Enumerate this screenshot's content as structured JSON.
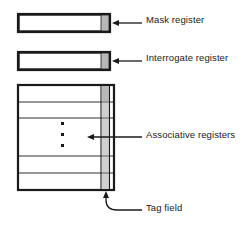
{
  "figure": {
    "background_color": "#ffffff",
    "line_color": "#1a1a1a",
    "tag_fill_color": "#b8b8b8",
    "cell_fill_color": "#ffffff"
  },
  "labels": {
    "mask": "Mask register",
    "interrogate": "Interrogate register",
    "associative": "Associative registers",
    "tag_field": "Tag field"
  },
  "registers": {
    "mask": {
      "name": "Mask register",
      "rows": 1,
      "has_tag_cell": true
    },
    "interrogate": {
      "name": "Interrogate register",
      "rows": 1,
      "has_tag_cell": true
    },
    "associative": {
      "name": "Associative registers",
      "rows": 6,
      "has_tag_column": true,
      "ellipsis": "vertical-ellipsis",
      "ellipsis_dots": 3
    }
  },
  "connectors": [
    {
      "name": "mask-arrow",
      "target": "mask-tag-cell",
      "direction": "left",
      "style": "straight"
    },
    {
      "name": "interrogate-arrow",
      "target": "interrogate-tag-cell",
      "direction": "left",
      "style": "straight"
    },
    {
      "name": "associative-arrow",
      "target": "associative-block",
      "direction": "left",
      "style": "straight"
    },
    {
      "name": "tag-field-arrow",
      "target": "tag-column-bottom",
      "direction": "up",
      "style": "elbow"
    }
  ]
}
